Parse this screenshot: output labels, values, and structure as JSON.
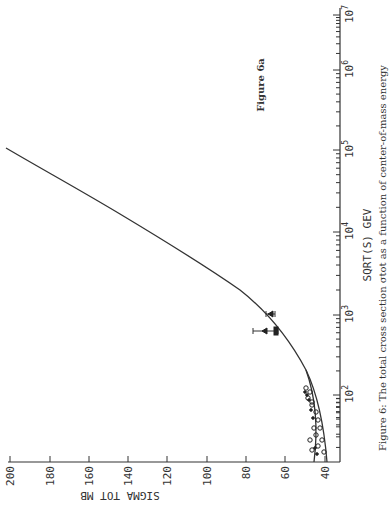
{
  "chart_data": {
    "type": "line",
    "orientation": "rotated-90-ccw",
    "title": "Figure 6a",
    "caption": "Figure 6: The total cross section σ_tot as a function of center-of-mass energy",
    "xlabel": "SQRT(S) GEV",
    "ylabel": "SIGMA TOT MB",
    "xscale": "log",
    "xlim": [
      5,
      10000000
    ],
    "ylim": [
      35,
      205
    ],
    "x_ticks": [
      "10^2",
      "10^3",
      "10^4",
      "10^5",
      "10^6",
      "10^7"
    ],
    "y_ticks": [
      "40",
      "60",
      "80",
      "100",
      "120",
      "140",
      "160",
      "180",
      "200"
    ],
    "grid": false,
    "series": [
      {
        "name": "fit curve",
        "style": "line",
        "x": [
          10,
          20,
          50,
          100,
          300,
          1000,
          3000,
          10000,
          100000,
          1000000,
          10000000
        ],
        "values": [
          40,
          40.5,
          42,
          44,
          49,
          60,
          72,
          88,
          120,
          150,
          190
        ]
      },
      {
        "name": "lower-energy data (ISR)",
        "style": "points-open-circle",
        "x": [
          10,
          15,
          20,
          25,
          30,
          40,
          50,
          60,
          80,
          100
        ],
        "values": [
          39.5,
          40,
          40.5,
          41,
          41.5,
          42,
          42.5,
          43,
          43.5,
          44
        ]
      },
      {
        "name": "SPS / Tevatron points",
        "style": "points-with-xerror",
        "x": [
          546,
          900,
          1800
        ],
        "values": [
          61,
          65,
          72
        ]
      }
    ],
    "annotations": [
      "Figure 6a"
    ]
  },
  "labels": {
    "figure_tag": "Figure 6a",
    "xaxis_title": "SQRT(S) GEV",
    "yaxis_title": "SIGMA TOT MB",
    "caption": "Figure 6: The total cross section σtot as a function of center-of-mass energy",
    "xticks": [
      {
        "base": "10",
        "exp": "2"
      },
      {
        "base": "10",
        "exp": "3"
      },
      {
        "base": "10",
        "exp": "4"
      },
      {
        "base": "10",
        "exp": "5"
      },
      {
        "base": "10",
        "exp": "6"
      },
      {
        "base": "10",
        "exp": "7"
      }
    ],
    "yticks": [
      "200",
      "180",
      "160",
      "140",
      "120",
      "100",
      "80",
      "60",
      "40"
    ]
  }
}
